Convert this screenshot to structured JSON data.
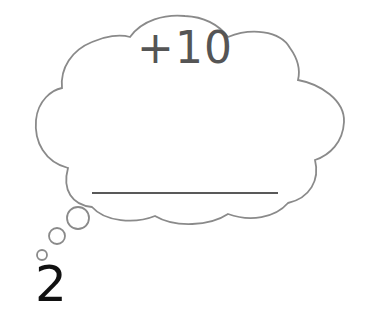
{
  "thought_cloud": {
    "operation_label": "+10",
    "answer_blank": "",
    "outline_color": "#8a8a8a",
    "line_color": "#222222"
  },
  "start_value": "2",
  "thought_bubbles": [
    {
      "name": "large",
      "cx": 78,
      "cy": 218,
      "r": 11
    },
    {
      "name": "medium",
      "cx": 57,
      "cy": 236,
      "r": 8
    },
    {
      "name": "small",
      "cx": 42,
      "cy": 255,
      "r": 5
    }
  ]
}
